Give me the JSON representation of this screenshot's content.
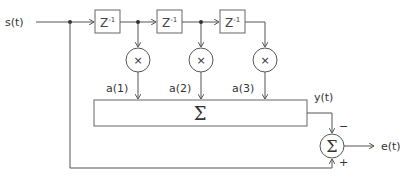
{
  "diagram": {
    "input_label": "s(t)",
    "output_label": "e(t)",
    "filter_output_label": "y(t)",
    "delays": [
      {
        "label": "Z",
        "exp": "-1"
      },
      {
        "label": "Z",
        "exp": "-1"
      },
      {
        "label": "Z",
        "exp": "-1"
      }
    ],
    "multipliers": [
      {
        "symbol": "×",
        "coef": "a(1)"
      },
      {
        "symbol": "×",
        "coef": "a(2)"
      },
      {
        "symbol": "×",
        "coef": "a(3)"
      }
    ],
    "summer_symbol": "Σ",
    "error_summer": {
      "symbol": "Σ",
      "minus": "−",
      "plus": "+"
    },
    "colors": {
      "line": "#555555",
      "text": "#333333",
      "box": "#666666"
    }
  }
}
